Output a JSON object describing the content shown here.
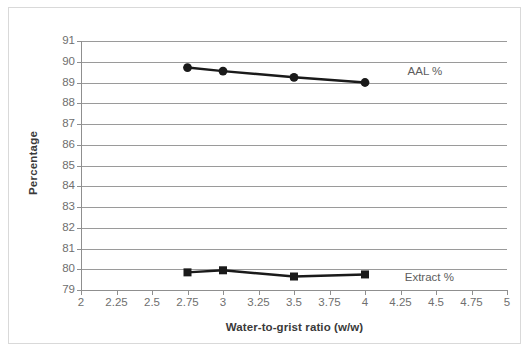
{
  "chart_data": {
    "type": "line",
    "title": "",
    "xlabel": "Water-to-grist ratio (w/w)",
    "ylabel": "Percentage",
    "xlim": [
      2,
      5
    ],
    "ylim": [
      79,
      91
    ],
    "x_ticks": [
      2,
      2.25,
      2.5,
      2.75,
      3,
      3.25,
      3.5,
      3.75,
      4,
      4.25,
      4.5,
      4.75,
      5
    ],
    "x_tick_labels": [
      "2",
      "2.25",
      "2.5",
      "2.75",
      "3",
      "3.25",
      "3.5",
      "3.75",
      "4",
      "4.25",
      "4.5",
      "4.75",
      "5"
    ],
    "y_ticks": [
      79,
      80,
      81,
      82,
      83,
      84,
      85,
      86,
      87,
      88,
      89,
      90,
      91
    ],
    "y_tick_labels": [
      "79",
      "80",
      "81",
      "82",
      "83",
      "84",
      "85",
      "86",
      "87",
      "88",
      "89",
      "90",
      "91"
    ],
    "grid": "horizontal",
    "legend_position": "inline-right",
    "series": [
      {
        "name": "AAL %",
        "marker": "circle",
        "color": "#1a1a1a",
        "x": [
          2.75,
          3,
          3.5,
          4
        ],
        "values": [
          89.72,
          89.55,
          89.25,
          89.0
        ],
        "label_x": 4.3,
        "label_y": 89.5
      },
      {
        "name": "Extract %",
        "marker": "square",
        "color": "#1a1a1a",
        "x": [
          2.75,
          3,
          3.5,
          4
        ],
        "values": [
          79.85,
          79.95,
          79.65,
          79.75
        ],
        "label_x": 4.28,
        "label_y": 79.58
      }
    ]
  },
  "colors": {
    "series": "#1a1a1a",
    "gridline": "#9a9a9a",
    "axis": "#8f8f8f",
    "tick_label": "#6f6f6f",
    "axis_title": "#3a3a3a",
    "frame": "#d9d9d9",
    "background": "#ffffff"
  }
}
